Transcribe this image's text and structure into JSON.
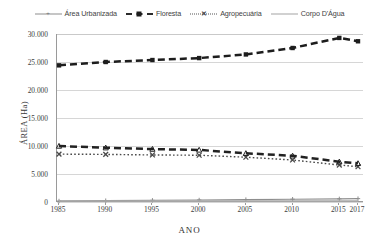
{
  "chart_data": {
    "type": "line",
    "title": "",
    "xlabel": "ANO",
    "ylabel": "ÁREA (Ha)",
    "x": [
      1985,
      1990,
      1995,
      2000,
      2005,
      2010,
      2015,
      2017
    ],
    "xtick_labels": [
      "1985",
      "1990",
      "1995",
      "2000",
      "2005",
      "2010",
      "2015",
      "2017"
    ],
    "ytick_labels": [
      "0",
      "5.000",
      "10.000",
      "15.000",
      "20.000",
      "25.000",
      "30.000"
    ],
    "ytick_values": [
      0,
      5000,
      10000,
      15000,
      20000,
      25000,
      30000
    ],
    "ylim": [
      0,
      30000
    ],
    "grid": "horizontal",
    "legend_position": "top",
    "series": [
      {
        "name": "Área Urbanizada",
        "style": "solid-thin-marker",
        "color": "#8e8e8e",
        "marker": "plus",
        "values": [
          180,
          240,
          300,
          360,
          430,
          500,
          560,
          600
        ]
      },
      {
        "name": "Floresta",
        "style": "dashed-bold-marker",
        "color": "#1d1d1d",
        "marker": "square",
        "values": [
          24400,
          25000,
          25350,
          25700,
          26350,
          27500,
          29300,
          28700
        ]
      },
      {
        "name": "Agropecuária",
        "style": "dotted-marker",
        "color": "#4a4a4a",
        "marker": "x",
        "values": [
          8550,
          8500,
          8400,
          8350,
          8000,
          7500,
          6600,
          6300
        ]
      },
      {
        "name": "Corpo D'Água",
        "style": "solid-grey",
        "color": "#a9a9a9",
        "marker": "none",
        "values": [
          180,
          180,
          180,
          180,
          180,
          180,
          180,
          180
        ]
      },
      {
        "name": "Série secundária",
        "style": "dashed-bold",
        "color": "#222222",
        "marker": "triangle",
        "values": [
          10000,
          9700,
          9450,
          9300,
          8700,
          8250,
          7200,
          6900
        ]
      }
    ]
  },
  "legend": {
    "items": [
      {
        "label": "Área Urbanizada",
        "swatch": "sw-solid-thin",
        "marker": "+"
      },
      {
        "label": "Floresta",
        "swatch": "sw-dash-bold",
        "marker": ""
      },
      {
        "label": "Agropecuária",
        "swatch": "sw-dot",
        "marker": "✕"
      },
      {
        "label": "Corpo D'Água",
        "swatch": "sw-solid-grey",
        "marker": ""
      }
    ]
  },
  "axes": {
    "y_title": "ÁREA (Ha)",
    "x_title": "ANO"
  }
}
